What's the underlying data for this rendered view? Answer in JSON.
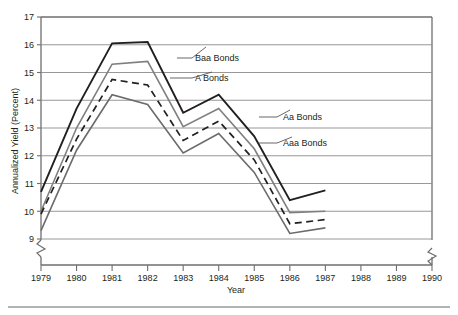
{
  "chart_data": {
    "type": "line",
    "title": "",
    "xlabel": "Year",
    "ylabel": "Annualized Yield (Percent)",
    "x": [
      1979,
      1980,
      1981,
      1982,
      1983,
      1984,
      1985,
      1986,
      1987
    ],
    "xlim": [
      1979,
      1990
    ],
    "ylim": [
      9,
      17
    ],
    "xticks": [
      1979,
      1980,
      1981,
      1982,
      1983,
      1984,
      1985,
      1986,
      1987,
      1988,
      1989,
      1990
    ],
    "xtick_labels": [
      "1979",
      "1980",
      "1981",
      "1982",
      "1983",
      "1984",
      "1985",
      "1986",
      "1987",
      "1988",
      "1989",
      "1990"
    ],
    "yticks": [
      9,
      10,
      11,
      12,
      13,
      14,
      15,
      16,
      17
    ],
    "ytick_labels": [
      "9",
      "10",
      "11",
      "12",
      "13",
      "14",
      "15",
      "16",
      "17"
    ],
    "grid": true,
    "grid_axis": "y",
    "legend_position": "inline-annotations",
    "y_axis_break": true,
    "x_axis_break": true,
    "x_axis_break_between": [
      1987,
      1990
    ],
    "series": [
      {
        "name": "Baa Bonds",
        "color": "#231f20",
        "style": "solid",
        "width": 1.9,
        "values": [
          10.7,
          13.7,
          16.05,
          16.1,
          13.55,
          14.2,
          12.7,
          10.4,
          10.75
        ],
        "label_anchor": {
          "x": 1982.45,
          "y": 15.45
        },
        "label_text_x": 195,
        "label_text_y": 61,
        "leader": [
          [
            177,
            58
          ],
          [
            192,
            58
          ],
          [
            206,
            47
          ]
        ]
      },
      {
        "name": "A Bonds",
        "color": "#7f7f7f",
        "style": "solid",
        "width": 1.6,
        "values": [
          10.0,
          13.0,
          15.3,
          15.4,
          13.05,
          13.7,
          12.25,
          9.95,
          10.0
        ],
        "label_anchor": {
          "x": 1982.6,
          "y": 14.7
        },
        "label_text_x": 195,
        "label_text_y": 81,
        "leader": [
          [
            170,
            78
          ],
          [
            192,
            78
          ],
          [
            212,
            72
          ]
        ]
      },
      {
        "name": "Aa Bonds",
        "color": "#231f20",
        "style": "dashed",
        "width": 1.7,
        "values": [
          9.9,
          12.6,
          14.75,
          14.55,
          12.55,
          13.25,
          11.85,
          9.55,
          9.7
        ],
        "label_anchor": {
          "x": 1985.0,
          "y": 13.05
        },
        "label_text_x": 283,
        "label_text_y": 120,
        "leader": [
          [
            259,
            117
          ],
          [
            277,
            117
          ],
          [
            290,
            110
          ]
        ]
      },
      {
        "name": "Aaa Bonds",
        "color": "#6b6b6b",
        "style": "solid",
        "width": 1.6,
        "values": [
          9.3,
          12.2,
          14.2,
          13.85,
          12.1,
          12.8,
          11.4,
          9.2,
          9.4
        ],
        "label_anchor": {
          "x": 1985.2,
          "y": 12.05
        },
        "label_text_x": 283,
        "label_text_y": 146,
        "leader": [
          [
            259,
            143
          ],
          [
            277,
            143
          ],
          [
            292,
            137
          ]
        ]
      }
    ]
  },
  "figure": {
    "frame_color": "#6e6e6e",
    "grid_color": "#8c8c8c",
    "background": "#ffffff",
    "bottom_rule_color": "#9a9a9a"
  }
}
